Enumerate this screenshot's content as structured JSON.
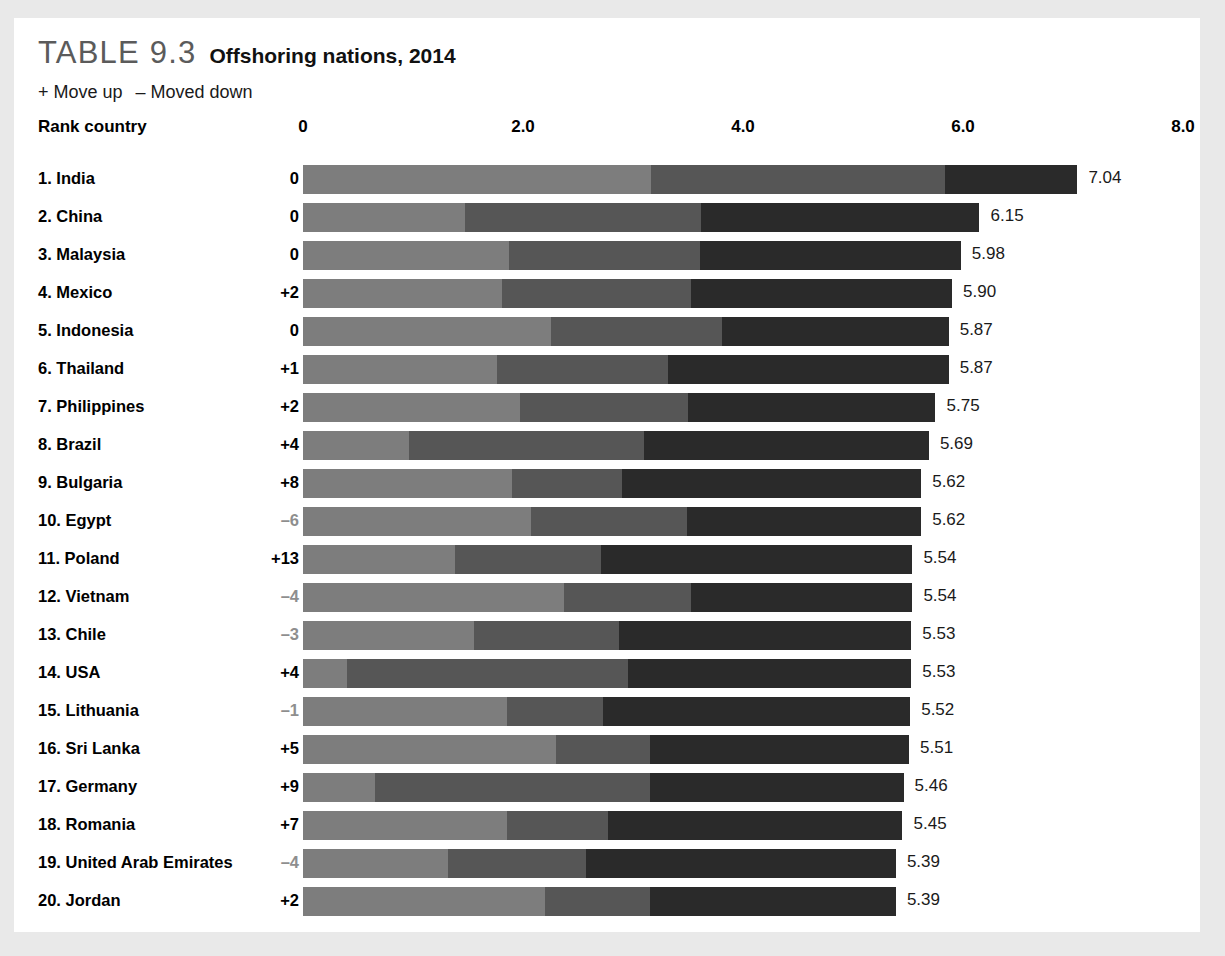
{
  "header": {
    "table_number": "TABLE 9.3",
    "caption": "Offshoring nations, 2014",
    "legend_up": "+ Move up",
    "legend_down": "– Moved down",
    "rank_column_label": "Rank country"
  },
  "colors": {
    "segment_1": "#7d7d7d",
    "segment_2": "#565656",
    "segment_3": "#2a2a2a",
    "page_background": "#e9e9e9",
    "card_background": "#ffffff",
    "negative_delta_text": "#8e8e8e",
    "table_number_text": "#5b5b5b"
  },
  "chart_data": {
    "type": "bar",
    "title": "Offshoring nations, 2014",
    "subtitle": "TABLE 9.3",
    "stacked": true,
    "orientation": "horizontal",
    "xlabel": "",
    "ylabel": "",
    "xlim": [
      0,
      8
    ],
    "grid": false,
    "legend_position": "none",
    "axis_ticks": [
      "0",
      "2.0",
      "4.0",
      "6.0",
      "8.0"
    ],
    "axis_tick_values": [
      0,
      2.0,
      4.0,
      6.0,
      8.0
    ],
    "series": [
      {
        "name": "segment-1",
        "values": [
          3.16,
          1.47,
          1.87,
          1.81,
          2.25,
          1.76,
          1.97,
          0.96,
          1.9,
          2.07,
          1.38,
          2.37,
          1.55,
          0.4,
          1.85,
          2.3,
          0.65,
          1.85,
          1.32,
          2.2
        ]
      },
      {
        "name": "segment-2",
        "values": [
          2.68,
          2.15,
          1.74,
          1.72,
          1.56,
          1.56,
          1.53,
          2.14,
          1.0,
          1.42,
          1.33,
          1.16,
          1.32,
          2.55,
          0.88,
          0.85,
          2.5,
          0.92,
          1.25,
          0.95
        ]
      },
      {
        "name": "segment-3",
        "values": [
          1.2,
          2.53,
          2.37,
          2.37,
          2.06,
          2.55,
          2.25,
          2.59,
          2.72,
          2.13,
          2.83,
          2.01,
          2.66,
          2.58,
          2.79,
          2.36,
          2.31,
          2.68,
          2.82,
          2.24
        ]
      }
    ],
    "totals": [
      7.04,
      6.15,
      5.98,
      5.9,
      5.87,
      5.87,
      5.75,
      5.69,
      5.62,
      5.62,
      5.54,
      5.54,
      5.53,
      5.53,
      5.52,
      5.51,
      5.46,
      5.45,
      5.39,
      5.39
    ],
    "categories": [
      "1. India",
      "2. China",
      "3. Malaysia",
      "4. Mexico",
      "5. Indonesia",
      "6. Thailand",
      "7. Philippines",
      "8. Brazil",
      "9. Bulgaria",
      "10. Egypt",
      "11. Poland",
      "12. Vietnam",
      "13. Chile",
      "14. USA",
      "15. Lithuania",
      "16. Sri Lanka",
      "17. Germany",
      "18. Romania",
      "19. United Arab Emirates",
      "20. Jordan"
    ]
  },
  "rows": [
    {
      "country": "1. India",
      "delta": "0",
      "negative": false,
      "value": "7.04",
      "total": 7.04,
      "segments": [
        3.16,
        2.68,
        1.2
      ]
    },
    {
      "country": "2. China",
      "delta": "0",
      "negative": false,
      "value": "6.15",
      "total": 6.15,
      "segments": [
        1.47,
        2.15,
        2.53
      ]
    },
    {
      "country": "3. Malaysia",
      "delta": "0",
      "negative": false,
      "value": "5.98",
      "total": 5.98,
      "segments": [
        1.87,
        1.74,
        2.37
      ]
    },
    {
      "country": "4. Mexico",
      "delta": "+2",
      "negative": false,
      "value": "5.90",
      "total": 5.9,
      "segments": [
        1.81,
        1.72,
        2.37
      ]
    },
    {
      "country": "5. Indonesia",
      "delta": "0",
      "negative": false,
      "value": "5.87",
      "total": 5.87,
      "segments": [
        2.25,
        1.56,
        2.06
      ]
    },
    {
      "country": "6. Thailand",
      "delta": "+1",
      "negative": false,
      "value": "5.87",
      "total": 5.87,
      "segments": [
        1.76,
        1.56,
        2.55
      ]
    },
    {
      "country": "7. Philippines",
      "delta": "+2",
      "negative": false,
      "value": "5.75",
      "total": 5.75,
      "segments": [
        1.97,
        1.53,
        2.25
      ]
    },
    {
      "country": "8. Brazil",
      "delta": "+4",
      "negative": false,
      "value": "5.69",
      "total": 5.69,
      "segments": [
        0.96,
        2.14,
        2.59
      ]
    },
    {
      "country": "9. Bulgaria",
      "delta": "+8",
      "negative": false,
      "value": "5.62",
      "total": 5.62,
      "segments": [
        1.9,
        1.0,
        2.72
      ]
    },
    {
      "country": "10. Egypt",
      "delta": "–6",
      "negative": true,
      "value": "5.62",
      "total": 5.62,
      "segments": [
        2.07,
        1.42,
        2.13
      ]
    },
    {
      "country": "11. Poland",
      "delta": "+13",
      "negative": false,
      "value": "5.54",
      "total": 5.54,
      "segments": [
        1.38,
        1.33,
        2.83
      ]
    },
    {
      "country": "12. Vietnam",
      "delta": "–4",
      "negative": true,
      "value": "5.54",
      "total": 5.54,
      "segments": [
        2.37,
        1.16,
        2.01
      ]
    },
    {
      "country": "13. Chile",
      "delta": "–3",
      "negative": true,
      "value": "5.53",
      "total": 5.53,
      "segments": [
        1.55,
        1.32,
        2.66
      ]
    },
    {
      "country": "14. USA",
      "delta": "+4",
      "negative": false,
      "value": "5.53",
      "total": 5.53,
      "segments": [
        0.4,
        2.55,
        2.58
      ]
    },
    {
      "country": "15. Lithuania",
      "delta": "–1",
      "negative": true,
      "value": "5.52",
      "total": 5.52,
      "segments": [
        1.85,
        0.88,
        2.79
      ]
    },
    {
      "country": "16. Sri Lanka",
      "delta": "+5",
      "negative": false,
      "value": "5.51",
      "total": 5.51,
      "segments": [
        2.3,
        0.85,
        2.36
      ]
    },
    {
      "country": "17. Germany",
      "delta": "+9",
      "negative": false,
      "value": "5.46",
      "total": 5.46,
      "segments": [
        0.65,
        2.5,
        2.31
      ]
    },
    {
      "country": "18. Romania",
      "delta": "+7",
      "negative": false,
      "value": "5.45",
      "total": 5.45,
      "segments": [
        1.85,
        0.92,
        2.68
      ]
    },
    {
      "country": "19. United Arab Emirates",
      "delta": "–4",
      "negative": true,
      "value": "5.39",
      "total": 5.39,
      "segments": [
        1.32,
        1.25,
        2.82
      ]
    },
    {
      "country": "20. Jordan",
      "delta": "+2",
      "negative": false,
      "value": "5.39",
      "total": 5.39,
      "segments": [
        2.2,
        0.95,
        2.24
      ]
    }
  ]
}
